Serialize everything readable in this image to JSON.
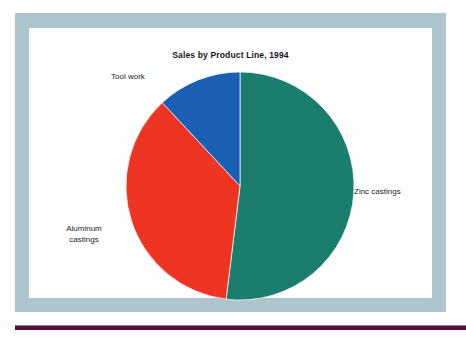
{
  "figure": {
    "title": "Sales by Product Line, 1994",
    "frame_color": "#aec5cd",
    "panel_color": "#ffffff",
    "rule_color": "#551038"
  },
  "labels": {
    "tool_work": "Tool work",
    "zinc_castings": "Zinc castings",
    "aluminum_castings": "Aluminum\ncastings"
  },
  "chart_data": {
    "type": "pie",
    "title": "Sales by Product Line, 1994",
    "xlabel": "",
    "ylabel": "",
    "categories": [
      "Zinc castings",
      "Aluminum castings",
      "Tool work"
    ],
    "values": [
      52,
      36,
      12
    ],
    "units": "percent of sales",
    "colors": [
      "#1a7d6e",
      "#ee3524",
      "#1a5fb4"
    ],
    "start_angle_deg": 0,
    "direction": "clockwise",
    "legend": "none",
    "labels_placement": "outside-callout",
    "grid": false,
    "slices": [
      {
        "name": "Zinc castings",
        "value": 52,
        "color": "#1a7d6e",
        "start_deg": 0,
        "end_deg": 187,
        "label": "Zinc castings"
      },
      {
        "name": "Aluminum castings",
        "value": 36,
        "color": "#ee3524",
        "start_deg": 187,
        "end_deg": 317,
        "label": "Aluminum castings"
      },
      {
        "name": "Tool work",
        "value": 12,
        "color": "#1a5fb4",
        "start_deg": 317,
        "end_deg": 360,
        "label": "Tool work"
      }
    ]
  }
}
